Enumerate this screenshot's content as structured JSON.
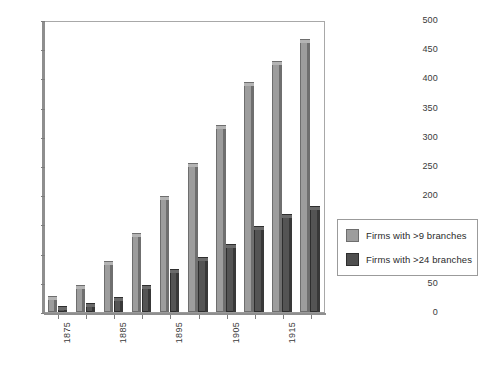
{
  "chart_data": {
    "type": "bar",
    "title": "",
    "xlabel": "",
    "ylabel": "",
    "grid": false,
    "legend_position": "right",
    "ylim": [
      0,
      500
    ],
    "ytick_step": 50,
    "yticks": [
      0,
      50,
      100,
      150,
      200,
      250,
      300,
      350,
      400,
      450,
      500
    ],
    "categories": [
      "1875",
      "1880",
      "1885",
      "1890",
      "1895",
      "1900",
      "1905",
      "1910",
      "1915",
      "1920"
    ],
    "visible_tick_labels": [
      "1875",
      "1885",
      "1895",
      "1905",
      "1915"
    ],
    "series": [
      {
        "name": "Firms with >9 branches",
        "color": "#9d9d9d",
        "values": [
          28,
          47,
          88,
          135,
          199,
          256,
          320,
          394,
          430,
          468
        ]
      },
      {
        "name": "Firms with >24 branches",
        "color": "#4f4f4f",
        "values": [
          10,
          16,
          25,
          47,
          74,
          95,
          117,
          148,
          167,
          181
        ]
      }
    ]
  },
  "legend": {
    "entries": [
      {
        "label": "Firms with >9 branches",
        "swatch": "light"
      },
      {
        "label": "Firms with >24 branches",
        "swatch": "dark"
      }
    ]
  },
  "colors": {
    "bar_light": "#9d9d9d",
    "bar_dark": "#4f4f4f",
    "axis": "#8e8e8e",
    "frame": "#9b9b9b",
    "background": "#ffffff",
    "text": "#2b2b2b"
  }
}
